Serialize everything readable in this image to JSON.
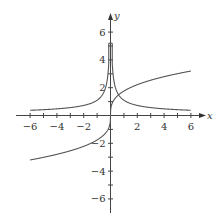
{
  "chart_data": {
    "type": "line",
    "title": "",
    "xlabel": "x",
    "ylabel": "y",
    "xlim": [
      -7,
      7
    ],
    "ylim": [
      -7,
      7
    ],
    "grid": false,
    "x_ticks": [
      -6,
      -5,
      -4,
      -3,
      -2,
      -1,
      1,
      2,
      3,
      4,
      5,
      6
    ],
    "x_tick_labels": [
      "-6",
      "-4",
      "-2",
      "2",
      "4",
      "6"
    ],
    "x_tick_label_values": [
      -6,
      -4,
      -2,
      2,
      4,
      6
    ],
    "y_ticks": [
      -6,
      -5,
      -4,
      -3,
      -2,
      -1,
      1,
      2,
      3,
      4,
      5,
      6
    ],
    "y_tick_labels": [
      "6",
      "4",
      "2",
      "-2",
      "-4",
      "-6"
    ],
    "y_tick_label_values": [
      6,
      4,
      2,
      -2,
      -4,
      -6
    ],
    "series": [
      {
        "name": "decreasing reciprocal-like curve (even, clipped near y=5)",
        "x": [
          -6,
          -4,
          -2,
          -1,
          -0.5,
          -0.2,
          -0.1,
          0.1,
          0.2,
          0.5,
          1,
          2,
          4,
          6
        ],
        "y": [
          0.37,
          0.48,
          0.73,
          1.1,
          1.67,
          2.9,
          5.2,
          5.2,
          2.9,
          1.67,
          1.1,
          0.73,
          0.48,
          0.37
        ]
      },
      {
        "name": "cube-root-like curve (odd)",
        "x": [
          -6,
          -4,
          -2,
          -1,
          -0.5,
          -0.1,
          0,
          0.1,
          0.5,
          1,
          2,
          4,
          6
        ],
        "y": [
          -3.2,
          -2.8,
          -2.2,
          -1.76,
          -1.4,
          -0.82,
          0,
          0.82,
          1.4,
          1.76,
          2.2,
          2.8,
          3.2
        ]
      }
    ]
  },
  "labels": {
    "x_axis": "x",
    "y_axis": "y"
  }
}
